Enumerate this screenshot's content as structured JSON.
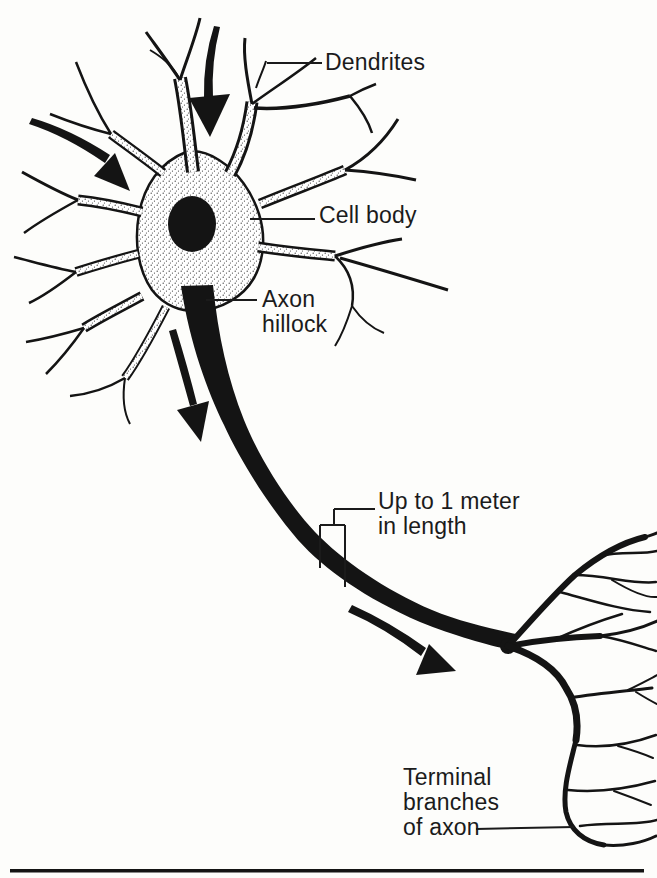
{
  "diagram": {
    "labels": {
      "dendrites": {
        "lines": [
          "Dendrites"
        ]
      },
      "cell_body": {
        "lines": [
          "Cell body"
        ]
      },
      "axon_hillock": {
        "lines": [
          "Axon",
          "hillock"
        ]
      },
      "axon_length": {
        "lines": [
          "Up to 1 meter",
          "in length"
        ]
      },
      "terminal_branches": {
        "lines": [
          "Terminal",
          "branches",
          "of axon"
        ]
      }
    },
    "colors": {
      "ink": "#141414",
      "paper": "#fdfdfb"
    }
  }
}
